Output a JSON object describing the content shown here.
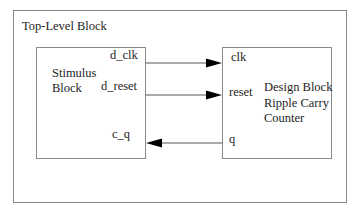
{
  "top_block": {
    "label": "Top-Level Block"
  },
  "stimulus_block": {
    "name_line1": "Stimulus",
    "name_line2": "Block",
    "ports": {
      "clk": "d_clk",
      "reset": "d_reset",
      "q": "c_q"
    }
  },
  "design_block": {
    "name_line1": "Design Block",
    "name_line2": "Ripple Carry",
    "name_line3": "Counter",
    "ports": {
      "clk": "clk",
      "reset": "reset",
      "q": "q"
    }
  },
  "connections": [
    {
      "from": "d_clk",
      "to": "clk",
      "direction": "right"
    },
    {
      "from": "d_reset",
      "to": "reset",
      "direction": "right"
    },
    {
      "from": "q",
      "to": "c_q",
      "direction": "left"
    }
  ],
  "colors": {
    "border": "#8a8a8a",
    "wire": "#555555",
    "arrow": "#000000",
    "text": "#1e1e1e"
  }
}
